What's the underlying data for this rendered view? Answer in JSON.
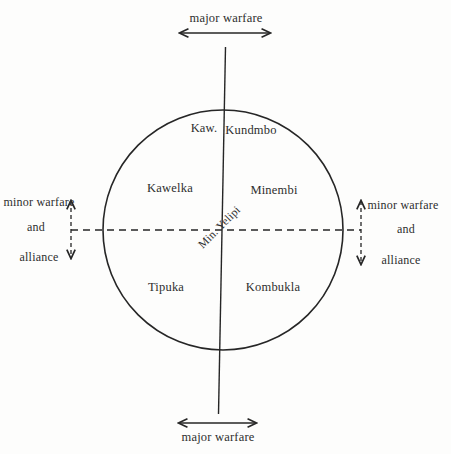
{
  "diagram": {
    "colors": {
      "background": "#fdfdfc",
      "line": "#262626",
      "text": "#2e2e2e"
    },
    "top_axis": {
      "label": "major warfare"
    },
    "bottom_axis": {
      "label": "major warfare"
    },
    "left_axis": {
      "line1": "minor warfare",
      "line2": "and",
      "line3": "alliance"
    },
    "right_axis": {
      "line1": "minor warfare",
      "line2": "and",
      "line3": "alliance"
    },
    "groups": {
      "top_left": "Kaw.",
      "top_right": "Kundmbo",
      "middle_left": "Kawelka",
      "middle_right": "Minembi",
      "center": "Min. Yelipi",
      "bottom_left": "Tipuka",
      "bottom_right": "Kombukla"
    }
  }
}
